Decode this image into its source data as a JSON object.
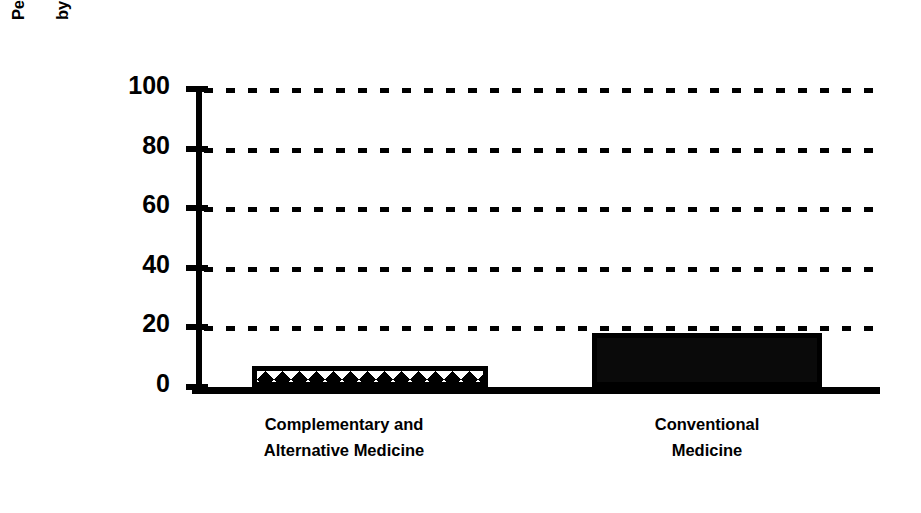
{
  "chart_data": {
    "type": "bar",
    "title": "",
    "subtitle": "",
    "xlabel": "",
    "ylabel": "Percentage of Interventions Verified by Scientific Research",
    "ylabel_lines": [
      "Percentage of Interventions Verified",
      "by Scientific Research"
    ],
    "categories": [
      "Complementary and Alternative Medicine",
      "Conventional Medicine"
    ],
    "category_lines": [
      [
        "Complementary and",
        "Alternative Medicine"
      ],
      [
        "Conventional",
        "Medicine"
      ]
    ],
    "values": [
      7,
      18
    ],
    "ylim": [
      0,
      100
    ],
    "yticks": [
      0,
      20,
      40,
      60,
      80,
      100
    ],
    "ytick_labels": [
      "0",
      "20",
      "40",
      "60",
      "80",
      "100"
    ],
    "grid": true,
    "grid_style": "dotted",
    "grid_axis": "y",
    "legend": false,
    "legend_position": "none",
    "bar_styles": [
      "crosshatch",
      "solid"
    ],
    "colors": {
      "bar_fill_solid": "#000000",
      "bar_fill_hatch_background": "#000000",
      "bar_fill_hatch_foreground": "#ffffff",
      "bar_edge": "#000000",
      "axis": "#000000",
      "grid": "#000000",
      "text": "#000000",
      "background": "#ffffff"
    }
  }
}
